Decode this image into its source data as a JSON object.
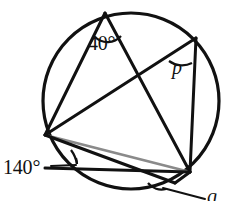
{
  "figure": {
    "kind": "circle-geometry-diagram",
    "background_color": "#ffffff",
    "stroke_color": "#111111",
    "accent_stroke_color": "#888888",
    "circle": {
      "cx": 131,
      "cy": 101,
      "r": 88,
      "stroke_width": 3.2
    },
    "points": {
      "A_top": {
        "x": 105,
        "y": 13
      },
      "B_upper_right": {
        "x": 196,
        "y": 38
      },
      "C_lower_right": {
        "x": 190,
        "y": 172
      },
      "D_left": {
        "x": 45,
        "y": 135
      },
      "E_bottom": {
        "x": 108,
        "y": 190
      }
    },
    "chords": [
      {
        "name": "chord-A-D",
        "from": "A_top",
        "to": "D_left",
        "color": "#111111",
        "width": 3.0
      },
      {
        "name": "chord-A-C",
        "from": "A_top",
        "to": "C_lower_right",
        "color": "#111111",
        "width": 3.0
      },
      {
        "name": "chord-B-D",
        "from": "B_upper_right",
        "to": "D_left",
        "color": "#111111",
        "width": 3.0
      },
      {
        "name": "chord-B-C",
        "from": "B_upper_right",
        "to": "C_lower_right",
        "color": "#111111",
        "width": 3.0
      },
      {
        "name": "chord-D-C-gray",
        "from": "D_left",
        "to": "C_lower_right",
        "color": "#888888",
        "width": 2.6
      },
      {
        "name": "chord-D-C-horizontal",
        "from": "D_left",
        "to": "C_lower_right",
        "color": "#111111",
        "width": 3.0,
        "note": "drawn flat through lower hull"
      },
      {
        "name": "chord-D-E",
        "from": "D_left",
        "to": "E_bottom",
        "color": "#111111",
        "width": 3.0
      },
      {
        "name": "chord-E-C",
        "from": "E_bottom",
        "to": "C_lower_right",
        "color": "#111111",
        "width": 3.0
      }
    ],
    "angles": [
      {
        "id": "angle-40",
        "label": "40°",
        "vertex": "A_top",
        "marker": "arc",
        "has_leader_line": false
      },
      {
        "id": "angle-p",
        "label": "p",
        "vertex": "B_upper_right",
        "marker": "arc",
        "italic": true,
        "has_leader_line": false
      },
      {
        "id": "angle-140",
        "label": "140°",
        "vertex": "D_left",
        "marker": "arc",
        "has_leader_line": true
      },
      {
        "id": "angle-q",
        "label": "q",
        "vertex": "E_bottom",
        "marker": "arc",
        "italic": true,
        "has_leader_line": true
      }
    ]
  }
}
